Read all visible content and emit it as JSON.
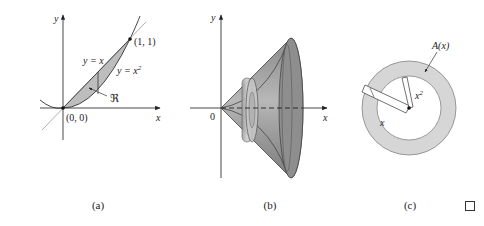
{
  "colors": {
    "axis": "#333333",
    "region_fill": "#bdbdbd",
    "solid_dark": "#7a7a7a",
    "solid_mid": "#9a9a9a",
    "solid_light": "#c4c4c4",
    "annulus_fill": "#d6d6d6",
    "line_light": "#aaaaaa"
  },
  "panels": [
    {
      "id": "a",
      "caption": "(a)",
      "axis_x_label": "x",
      "axis_y_label": "y",
      "curve1_label": "y = x",
      "curve2_label_base": "y = x",
      "curve2_label_sup": "2",
      "region_label": "ℜ",
      "origin_label": "(0, 0)",
      "point_label": "(1, 1)"
    },
    {
      "id": "b",
      "caption": "(b)",
      "axis_x_label": "x",
      "axis_y_label": "y",
      "origin_label": "0"
    },
    {
      "id": "c",
      "caption": "(c)",
      "area_label": "A(x)",
      "outer_radius_label": "x",
      "inner_radius_label_base": "x",
      "inner_radius_label_sup": "2"
    }
  ],
  "end_mark": "□"
}
